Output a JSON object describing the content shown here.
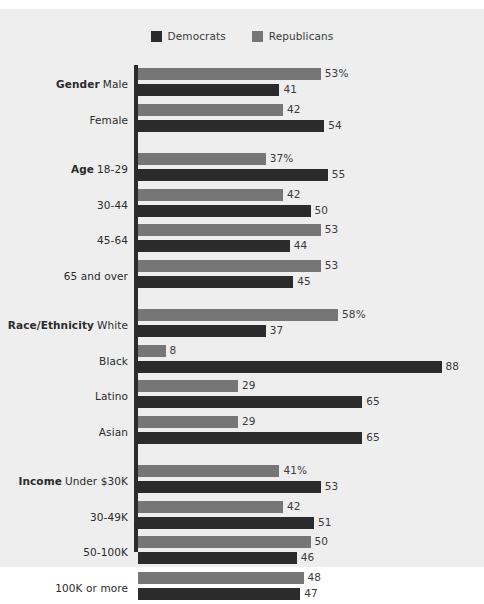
{
  "legend": {
    "items": [
      {
        "label": "Democrats",
        "color": "#2b2b2b",
        "key": "dem"
      },
      {
        "label": "Republicans",
        "color": "#767676",
        "key": "rep"
      }
    ]
  },
  "chart_data": {
    "type": "bar",
    "orientation": "horizontal",
    "title": "",
    "xlabel": "",
    "ylabel": "",
    "xlim": [
      0,
      88
    ],
    "grid": false,
    "legend_position": "top-center",
    "value_suffix_first_row": "%",
    "series": [
      {
        "name": "Republicans",
        "color": "#767676",
        "values": [
          53,
          42,
          37,
          42,
          53,
          53,
          58,
          8,
          29,
          29,
          41,
          42,
          50,
          48
        ]
      },
      {
        "name": "Democrats",
        "color": "#2b2b2b",
        "values": [
          41,
          54,
          55,
          50,
          44,
          45,
          37,
          88,
          65,
          65,
          53,
          51,
          46,
          47
        ]
      }
    ],
    "groups": [
      {
        "group": "Gender",
        "categories": [
          {
            "label": "Male",
            "rep": "53%",
            "dem": "41",
            "rep_val": 53,
            "dem_val": 41
          },
          {
            "label": "Female",
            "rep": "42",
            "dem": "54",
            "rep_val": 42,
            "dem_val": 54
          }
        ]
      },
      {
        "group": "Age",
        "categories": [
          {
            "label": "18-29",
            "rep": "37%",
            "dem": "55",
            "rep_val": 37,
            "dem_val": 55
          },
          {
            "label": "30-44",
            "rep": "42",
            "dem": "50",
            "rep_val": 42,
            "dem_val": 50
          },
          {
            "label": "45-64",
            "rep": "53",
            "dem": "44",
            "rep_val": 53,
            "dem_val": 44
          },
          {
            "label": "65 and over",
            "rep": "53",
            "dem": "45",
            "rep_val": 53,
            "dem_val": 45
          }
        ]
      },
      {
        "group": "Race/Ethnicity",
        "categories": [
          {
            "label": "White",
            "rep": "58%",
            "dem": "37",
            "rep_val": 58,
            "dem_val": 37
          },
          {
            "label": "Black",
            "rep": "8",
            "dem": "88",
            "rep_val": 8,
            "dem_val": 88
          },
          {
            "label": "Latino",
            "rep": "29",
            "dem": "65",
            "rep_val": 29,
            "dem_val": 65
          },
          {
            "label": "Asian",
            "rep": "29",
            "dem": "65",
            "rep_val": 29,
            "dem_val": 65
          }
        ]
      },
      {
        "group": "Income",
        "categories": [
          {
            "label": "Under $30K",
            "rep": "41%",
            "dem": "53",
            "rep_val": 41,
            "dem_val": 53
          },
          {
            "label": "30-49K",
            "rep": "42",
            "dem": "51",
            "rep_val": 42,
            "dem_val": 51
          },
          {
            "label": "50-100K",
            "rep": "50",
            "dem": "46",
            "rep_val": 50,
            "dem_val": 46
          },
          {
            "label": "100K or more",
            "rep": "48",
            "dem": "47",
            "rep_val": 48,
            "dem_val": 47
          }
        ]
      }
    ]
  }
}
